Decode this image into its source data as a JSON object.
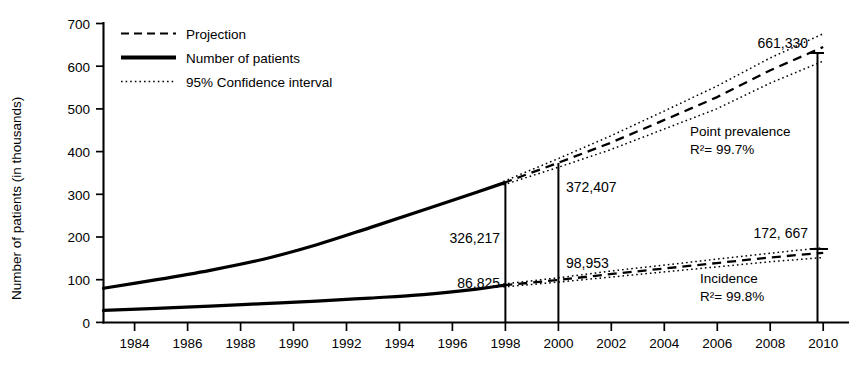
{
  "chart_data": {
    "type": "line",
    "title": "",
    "xlabel": "",
    "ylabel": "Number of patients (in thousands)",
    "xlim": [
      1983,
      2010
    ],
    "ylim": [
      0,
      700
    ],
    "grid": false,
    "legend_position": "top-left",
    "x_ticks": [
      "1984",
      "1986",
      "1988",
      "1990",
      "1992",
      "1994",
      "1996",
      "1998",
      "2000",
      "2002",
      "2004",
      "2006",
      "2008",
      "2010"
    ],
    "x_tick_values": [
      1984,
      1986,
      1988,
      1990,
      1992,
      1994,
      1996,
      1998,
      2000,
      2002,
      2004,
      2006,
      2008,
      2010
    ],
    "y_ticks": [
      "0",
      "100",
      "200",
      "300",
      "400",
      "500",
      "600",
      "700"
    ],
    "y_tick_values": [
      0,
      100,
      200,
      300,
      400,
      500,
      600,
      700
    ],
    "legend": [
      {
        "key": "projection",
        "label": "Projection",
        "style": "dashed"
      },
      {
        "key": "observed",
        "label": "Number of patients",
        "style": "solid"
      },
      {
        "key": "ci",
        "label": "95% Confidence interval",
        "style": "dotted"
      }
    ],
    "series": [
      {
        "name": "Point prevalence - Number of patients",
        "style": "solid",
        "x": [
          1983,
          1985,
          1987,
          1989,
          1991,
          1993,
          1995,
          1997,
          1998
        ],
        "values": [
          80,
          100,
          122,
          148,
          182,
          222,
          263,
          305,
          326.217
        ]
      },
      {
        "name": "Point prevalence - Projection",
        "style": "dashed",
        "x": [
          1998,
          2000,
          2002,
          2004,
          2006,
          2008,
          2010
        ],
        "values": [
          326.217,
          372.407,
          420,
          473,
          527,
          590,
          645
        ]
      },
      {
        "name": "Point prevalence - 95% CI upper",
        "style": "dotted",
        "x": [
          1998,
          2000,
          2002,
          2004,
          2006,
          2008,
          2010
        ],
        "values": [
          330,
          382,
          436,
          494,
          553,
          619,
          676
        ]
      },
      {
        "name": "Point prevalence - 95% CI lower",
        "style": "dotted",
        "x": [
          1998,
          2000,
          2002,
          2004,
          2006,
          2008,
          2010
        ],
        "values": [
          322,
          362,
          404,
          452,
          500,
          560,
          612
        ]
      },
      {
        "name": "Incidence - Number of patients",
        "style": "solid",
        "x": [
          1983,
          1985,
          1987,
          1989,
          1991,
          1993,
          1995,
          1997,
          1998
        ],
        "values": [
          28,
          33,
          38,
          44,
          50,
          57,
          65,
          78,
          86.825
        ]
      },
      {
        "name": "Incidence - Projection",
        "style": "dashed",
        "x": [
          1998,
          2000,
          2002,
          2004,
          2006,
          2008,
          2010
        ],
        "values": [
          86.825,
          98.953,
          113,
          126,
          139,
          152,
          163
        ]
      },
      {
        "name": "Incidence - 95% CI upper",
        "style": "dotted",
        "x": [
          1998,
          2000,
          2002,
          2004,
          2006,
          2008,
          2010
        ],
        "values": [
          90,
          104,
          120,
          134,
          148,
          162,
          175
        ]
      },
      {
        "name": "Incidence - 95% CI lower",
        "style": "dotted",
        "x": [
          1998,
          2000,
          2002,
          2004,
          2006,
          2008,
          2010
        ],
        "values": [
          83,
          94,
          106,
          118,
          130,
          142,
          152
        ]
      }
    ],
    "annotations": [
      {
        "key": "v1998_prev",
        "text": "326,217",
        "x": 1998,
        "y": 326.217
      },
      {
        "key": "v1998_inc",
        "text": "86,825",
        "x": 1998,
        "y": 86.825
      },
      {
        "key": "v2000_prev",
        "text": "372,407",
        "x": 2000,
        "y": 372.407
      },
      {
        "key": "v2000_inc",
        "text": "98,953",
        "x": 2000,
        "y": 98.953
      },
      {
        "key": "v2010_prev",
        "text": "661,330",
        "x": 2010,
        "y": 661.33
      },
      {
        "key": "v2010_inc",
        "text": "172, 667",
        "x": 2010,
        "y": 172.667
      }
    ],
    "group_labels": [
      {
        "key": "prevalence",
        "name": "Point prevalence",
        "r2": "R²= 99.7%"
      },
      {
        "key": "incidence",
        "name": "Incidence",
        "r2": "R²= 99.8%"
      }
    ],
    "colors": {
      "line": "#000000",
      "background": "#ffffff"
    }
  }
}
